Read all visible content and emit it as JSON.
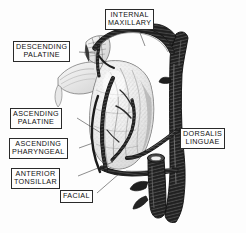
{
  "figure": {
    "background_color": "#fdfdfd",
    "ink_color": "#1a1a1a",
    "label_border_color": "#2a2a2a",
    "width": 246,
    "height": 233
  },
  "labels": {
    "internal_maxillary": {
      "line1": "INTERNAL",
      "line2": "MAXILLARY"
    },
    "descending_palatine": {
      "line1": "DESCENDING",
      "line2": "PALATINE"
    },
    "ascending_palatine": {
      "line1": "ASCENDING",
      "line2": "PALATINE"
    },
    "ascending_pharyngeal": {
      "line1": "ASCENDING",
      "line2": "PHARYNGEAL"
    },
    "anterior_tonsillar": {
      "line1": "ANTERIOR",
      "line2": "TONSILLAR"
    },
    "facial": {
      "line1": "FACIAL"
    },
    "dorsalis_linguae": {
      "line1": "DORSALIS",
      "line2": "LINGUAE"
    }
  }
}
